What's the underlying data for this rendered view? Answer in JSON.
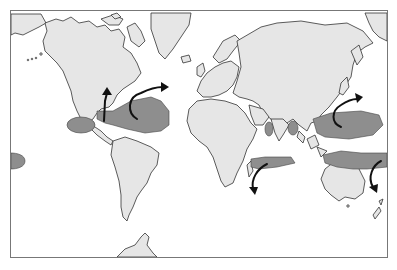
{
  "map": {
    "type": "world-map",
    "subject": "tropical cyclone formation regions and typical tracks",
    "colors": {
      "land": "#e6e6e6",
      "ocean": "#ffffff",
      "cyclone_zone": "#8e8e8e",
      "track_arrow": "#111111",
      "coastline": "#333333",
      "frame": "#777777"
    },
    "cyclone_zones": [
      {
        "id": "east-pacific",
        "region": "Eastern North Pacific (off Mexico)"
      },
      {
        "id": "atlantic-caribbean",
        "region": "North Atlantic / Caribbean / Gulf of Mexico"
      },
      {
        "id": "arabian-sea",
        "region": "Arabian Sea"
      },
      {
        "id": "bay-of-bengal",
        "region": "Bay of Bengal"
      },
      {
        "id": "west-pacific",
        "region": "Western North Pacific"
      },
      {
        "id": "south-indian",
        "region": "South Indian Ocean (Madagascar)"
      },
      {
        "id": "australia-south-pacific",
        "region": "Northern Australia / South Pacific"
      },
      {
        "id": "central-pacific-edge",
        "region": "Central Pacific (left edge)"
      }
    ],
    "tracks": [
      {
        "id": "gulf-track",
        "direction": "north"
      },
      {
        "id": "atlantic-track",
        "direction": "recurving north-east"
      },
      {
        "id": "west-pacific-track",
        "direction": "recurving north-east"
      },
      {
        "id": "south-indian-track",
        "direction": "recurving south"
      },
      {
        "id": "south-pacific-track",
        "direction": "recurving south"
      }
    ],
    "labels": []
  }
}
